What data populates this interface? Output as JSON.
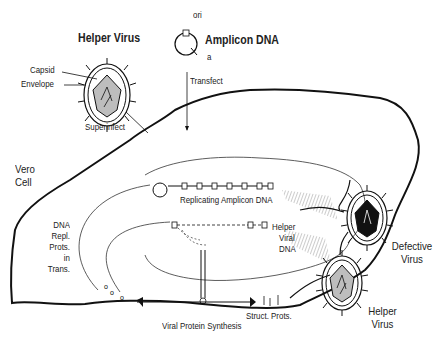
{
  "diagram": {
    "title_labels": {
      "helper_virus_top": "Helper Virus",
      "amplicon_dna": "Amplicon DNA",
      "ori": "ori",
      "a": "a",
      "capsid": "Capsid",
      "envelope": "Envelope",
      "transfect": "Transfect",
      "superinfect": "Superinfect",
      "vero_cell": "Vero Cell",
      "dna_repl_prots": [
        "DNA",
        "Repl.",
        "Prots.",
        "in",
        "Trans."
      ],
      "replicating_amplicon_dna": "Replicating Amplicon DNA",
      "helper_viral_dna": [
        "Helper",
        "Viral",
        "DNA"
      ],
      "viral_protein_synthesis": "Viral Protein Synthesis",
      "struct_prots": "Struct. Prots.",
      "defective_virus": [
        "Defective",
        "Virus"
      ],
      "helper_virus_bottom": [
        "Helper",
        "Virus"
      ]
    },
    "colors": {
      "line": "#1a1a1a",
      "capsid_fill": "#bdbdbd",
      "defective_capsid_fill": "#111111",
      "hatch": "#9a9a9a"
    }
  }
}
